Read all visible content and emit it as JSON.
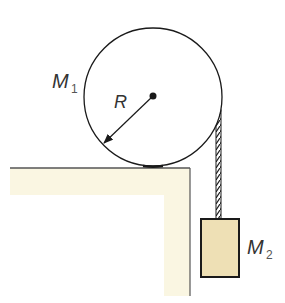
{
  "diagram": {
    "labels": {
      "m1": {
        "main": "M",
        "sub": "1"
      },
      "radius": "R",
      "m2": {
        "main": "M",
        "sub": "2"
      }
    },
    "colors": {
      "table_fill": "#faf6e2",
      "block_fill": "#eee0b5",
      "stroke": "#1a1a1a"
    },
    "geometry": {
      "cylinder": {
        "cx": 153,
        "cy": 97,
        "r": 69
      },
      "table_top_y": 168,
      "table_right_x": 190,
      "block": {
        "x": 201,
        "y": 219,
        "w": 38,
        "h": 58
      }
    }
  }
}
